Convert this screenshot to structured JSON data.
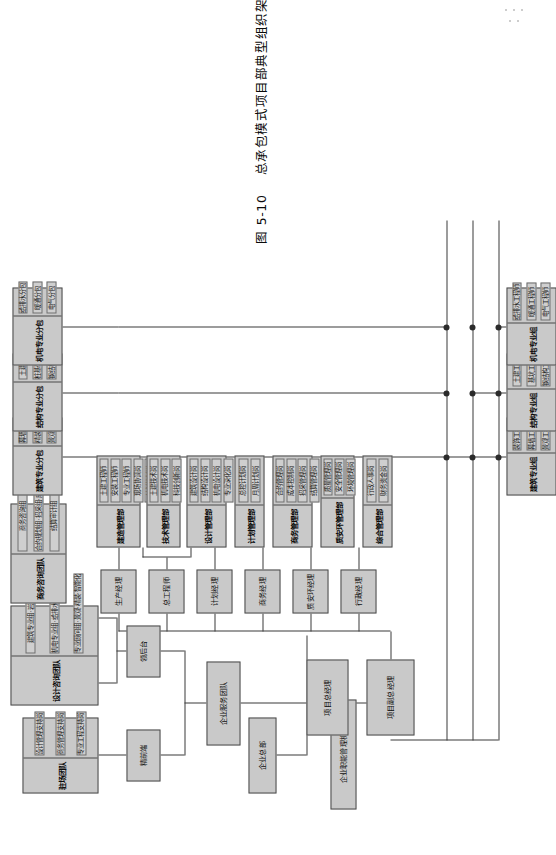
{
  "figure": {
    "caption_number": "图 5-10",
    "caption_title": "总承包模式项目部典型组织架构图",
    "orientation": "rotated-90-ccw",
    "accent_fill": "#c9c9c9",
    "line_color": "#3a3a3a"
  },
  "enterprise": {
    "headquarters": "企业总部",
    "functional_org": "企业职能管理机构",
    "service_team": "企业服务团队",
    "front_end": "精前端",
    "back_office": "领后台"
  },
  "support_teams": [
    {
      "title": "驻场团队",
      "items": [
        "设计管理支持岗",
        "商务管理支持岗",
        "专业工程支持岗"
      ]
    },
    {
      "title": "设计咨询团队",
      "items": [
        "建筑专业组·岩土·幕墙",
        "机电专业组·给排水·暖通·电气",
        "专业顾问组·景观·精装·智能化"
      ]
    },
    {
      "title": "商务咨询团队",
      "items": [
        "商务咨询组",
        "合约规划组·招采组·成本组",
        "结算审计组"
      ]
    }
  ],
  "project": {
    "general_manager": "项目总经理",
    "deputy_general_manager": "项目副总经理"
  },
  "managers": [
    {
      "role": "生产经理",
      "departments": [
        {
          "name": "建造管理部",
          "items": [
            "土建工程师",
            "安装工程师",
            "专业工程师",
            "现场协调岗",
            "计划控制岗"
          ]
        }
      ]
    },
    {
      "role": "总工程师",
      "departments": [
        {
          "name": "技术管理部",
          "items": [
            "土建技术岗",
            "机电技术岗",
            "科技创新岗"
          ]
        },
        {
          "name": "设计管理部",
          "items": [
            "建筑设计岗",
            "结构设计岗",
            "机电设计岗",
            "专业深化岗"
          ]
        }
      ]
    },
    {
      "role": "计划经理",
      "departments": [
        {
          "name": "计划管理部",
          "items": [
            "总控计划岗",
            "月周计划岗"
          ]
        }
      ]
    },
    {
      "role": "商务经理",
      "departments": [
        {
          "name": "商务管理部",
          "items": [
            "合约管理岗",
            "成本控制岗",
            "招采管理岗",
            "结算管理岗"
          ]
        }
      ]
    },
    {
      "role": "质安环经理",
      "departments": [
        {
          "name": "质安环管理部",
          "items": [
            "质量管理岗",
            "安全管理岗",
            "环境管理岗"
          ]
        }
      ]
    },
    {
      "role": "行政经理",
      "departments": [
        {
          "name": "综合管理部",
          "items": [
            "行政人事岗",
            "财务资金岗"
          ]
        }
      ]
    }
  ],
  "specialty_subcontracts": [
    {
      "title": "建筑专业分包",
      "items": [
        "幕墙分包",
        "精装分包",
        "景观分包"
      ]
    },
    {
      "title": "结构专业分包",
      "items": [
        "土建分包",
        "桩基础分包",
        "钢结构分包"
      ]
    },
    {
      "title": "机电专业分包",
      "items": [
        "给排水分包",
        "暖通分包",
        "电气分包"
      ]
    }
  ],
  "specialty_groups": [
    {
      "title": "建筑专业组",
      "items": [
        "装饰工程师",
        "幕墙工程师",
        "景观工程师"
      ]
    },
    {
      "title": "结构专业组",
      "items": [
        "土建工程师",
        "基坑工程师",
        "钢结构工程师"
      ]
    },
    {
      "title": "机电专业组",
      "items": [
        "给排水工程师",
        "暖通工程师",
        "电气工程师"
      ]
    }
  ]
}
